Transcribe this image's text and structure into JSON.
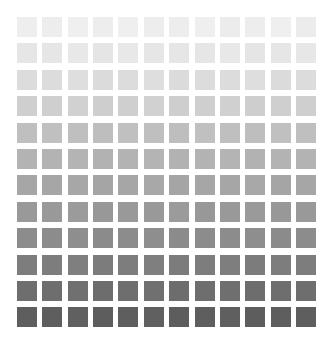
{
  "figure": {
    "title": "",
    "background_color": "#ffffff",
    "width": 333,
    "height": 355
  },
  "chart_data": {
    "type": "heatmap",
    "title": "",
    "subtitle": "",
    "xlabel": "",
    "ylabel": "",
    "rows": 12,
    "columns": 12,
    "grid": false,
    "legend": "none",
    "colormap": "grayscale",
    "cell_shape": "square",
    "cell_size_px": 20,
    "cell_gap_px": 5,
    "origin_px": [
      17,
      17
    ],
    "value_range": [
      0,
      1
    ],
    "row_labels": [
      "1",
      "2",
      "3",
      "4",
      "5",
      "6",
      "7",
      "8",
      "9",
      "10",
      "11",
      "12"
    ],
    "column_labels": [
      "1",
      "2",
      "3",
      "4",
      "5",
      "6",
      "7",
      "8",
      "9",
      "10",
      "11",
      "12"
    ],
    "row_base_colors": [
      "#ededed",
      "#e6e6e6",
      "#dcdcdc",
      "#cfcfcf",
      "#bfbfbf",
      "#b3b3b3",
      "#a6a6a6",
      "#999999",
      "#8c8c8c",
      "#7d7d7d",
      "#6e6e6e",
      "#5e5e5e"
    ],
    "row_values": [
      0.93,
      0.9,
      0.86,
      0.81,
      0.75,
      0.7,
      0.65,
      0.6,
      0.55,
      0.49,
      0.43,
      0.37
    ],
    "values": [
      [
        0.93,
        0.93,
        0.94,
        0.93,
        0.94,
        0.93,
        0.93,
        0.94,
        0.93,
        0.93,
        0.94,
        0.93
      ],
      [
        0.9,
        0.9,
        0.91,
        0.9,
        0.91,
        0.9,
        0.9,
        0.9,
        0.91,
        0.9,
        0.9,
        0.91
      ],
      [
        0.86,
        0.86,
        0.87,
        0.86,
        0.86,
        0.87,
        0.86,
        0.86,
        0.86,
        0.87,
        0.86,
        0.86
      ],
      [
        0.81,
        0.81,
        0.82,
        0.81,
        0.81,
        0.82,
        0.81,
        0.81,
        0.82,
        0.81,
        0.81,
        0.81
      ],
      [
        0.75,
        0.76,
        0.75,
        0.75,
        0.76,
        0.75,
        0.75,
        0.76,
        0.75,
        0.75,
        0.76,
        0.75
      ],
      [
        0.7,
        0.7,
        0.71,
        0.7,
        0.7,
        0.71,
        0.7,
        0.7,
        0.71,
        0.7,
        0.7,
        0.7
      ],
      [
        0.65,
        0.65,
        0.66,
        0.65,
        0.65,
        0.66,
        0.65,
        0.65,
        0.65,
        0.66,
        0.65,
        0.65
      ],
      [
        0.6,
        0.6,
        0.61,
        0.6,
        0.6,
        0.6,
        0.61,
        0.6,
        0.6,
        0.61,
        0.6,
        0.6
      ],
      [
        0.55,
        0.55,
        0.56,
        0.55,
        0.55,
        0.56,
        0.55,
        0.55,
        0.55,
        0.56,
        0.55,
        0.55
      ],
      [
        0.49,
        0.49,
        0.5,
        0.49,
        0.49,
        0.5,
        0.49,
        0.49,
        0.5,
        0.49,
        0.49,
        0.49
      ],
      [
        0.43,
        0.43,
        0.44,
        0.43,
        0.43,
        0.44,
        0.43,
        0.43,
        0.44,
        0.43,
        0.43,
        0.43
      ],
      [
        0.37,
        0.37,
        0.38,
        0.37,
        0.37,
        0.38,
        0.37,
        0.37,
        0.38,
        0.37,
        0.37,
        0.37
      ]
    ],
    "cell_colors": [
      [
        "#eeeeee",
        "#ededed",
        "#efefef",
        "#ededed",
        "#efefef",
        "#ededed",
        "#ededed",
        "#efefef",
        "#ececec",
        "#ededed",
        "#efefef",
        "#ececec"
      ],
      [
        "#e6e6e6",
        "#e6e6e6",
        "#e8e8e8",
        "#e5e5e5",
        "#e8e8e8",
        "#e6e6e6",
        "#e6e6e6",
        "#e6e6e6",
        "#e8e8e8",
        "#e5e5e5",
        "#e6e6e6",
        "#e7e7e7"
      ],
      [
        "#dcdcdc",
        "#dcdcdc",
        "#dedede",
        "#dbdbdb",
        "#dcdcdc",
        "#dedede",
        "#dbdbdb",
        "#dcdcdc",
        "#dcdcdc",
        "#dedede",
        "#dbdbdb",
        "#dcdcdc"
      ],
      [
        "#cfcfcf",
        "#cfcfcf",
        "#d1d1d1",
        "#cecece",
        "#cfcfcf",
        "#d1d1d1",
        "#cecece",
        "#cfcfcf",
        "#d0d0d0",
        "#cecece",
        "#cfcfcf",
        "#cfcfcf"
      ],
      [
        "#bfbfbf",
        "#c0c0c0",
        "#bfbfbf",
        "#bebebe",
        "#c0c0c0",
        "#bfbfbf",
        "#bebebe",
        "#c0c0c0",
        "#bfbfbf",
        "#bebebe",
        "#c0c0c0",
        "#bfbfbf"
      ],
      [
        "#b3b3b3",
        "#b3b3b3",
        "#b4b4b4",
        "#b2b2b2",
        "#b3b3b3",
        "#b4b4b4",
        "#b2b2b2",
        "#b3b3b3",
        "#b4b4b4",
        "#b2b2b2",
        "#b3b3b3",
        "#b3b3b3"
      ],
      [
        "#a6a6a6",
        "#a6a6a6",
        "#a7a7a7",
        "#a5a5a5",
        "#a6a6a6",
        "#a8a8a8",
        "#a5a5a5",
        "#a6a6a6",
        "#a6a6a6",
        "#a8a8a8",
        "#a5a5a5",
        "#a6a6a6"
      ],
      [
        "#999999",
        "#999999",
        "#9b9b9b",
        "#989898",
        "#999999",
        "#999999",
        "#9b9b9b",
        "#989898",
        "#999999",
        "#9a9a9a",
        "#989898",
        "#999999"
      ],
      [
        "#8c8c8c",
        "#8c8c8c",
        "#8e8e8e",
        "#8b8b8b",
        "#8c8c8c",
        "#8e8e8e",
        "#8b8b8b",
        "#8c8c8c",
        "#8c8c8c",
        "#8e8e8e",
        "#8b8b8b",
        "#8c8c8c"
      ],
      [
        "#7d7d7d",
        "#7d7d7d",
        "#7f7f7f",
        "#7c7c7c",
        "#7d7d7d",
        "#7f7f7f",
        "#7c7c7c",
        "#7d7d7d",
        "#7e7e7e",
        "#7c7c7c",
        "#7d7d7d",
        "#7d7d7d"
      ],
      [
        "#6e6e6e",
        "#6e6e6e",
        "#707070",
        "#6d6d6d",
        "#6e6e6e",
        "#707070",
        "#6d6d6d",
        "#6e6e6e",
        "#6f6f6f",
        "#6d6d6d",
        "#6e6e6e",
        "#6e6e6e"
      ],
      [
        "#5e5e5e",
        "#5e5e5e",
        "#606060",
        "#5d5d5d",
        "#5e5e5e",
        "#606060",
        "#5d5d5d",
        "#5e5e5e",
        "#5f5f5f",
        "#5d5d5d",
        "#5e5e5e",
        "#5e5e5e"
      ]
    ]
  }
}
